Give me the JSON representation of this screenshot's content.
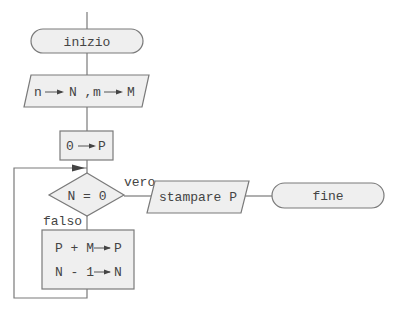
{
  "diagram": {
    "type": "flowchart",
    "colors": {
      "fill": "#efefef",
      "stroke": "#7a7a7a",
      "text": "#444444",
      "background": "#ffffff"
    },
    "nodes": {
      "start": {
        "shape": "terminal",
        "label": "inizio"
      },
      "input": {
        "shape": "parallelogram",
        "part1": "n",
        "part2": "N ,",
        "part3": "m",
        "part4": "M"
      },
      "init": {
        "shape": "process",
        "left": "0",
        "right": "P"
      },
      "decision": {
        "shape": "diamond",
        "label": "N = 0"
      },
      "output": {
        "shape": "parallelogram",
        "label": "stampare P"
      },
      "end": {
        "shape": "terminal",
        "label": "fine"
      },
      "loop_body": {
        "shape": "process",
        "line1_left": "P + M",
        "line1_right": "P",
        "line2_left": "N - 1",
        "line2_right": "N"
      }
    },
    "edges": {
      "true_label": "vero",
      "false_label": "falso"
    }
  }
}
